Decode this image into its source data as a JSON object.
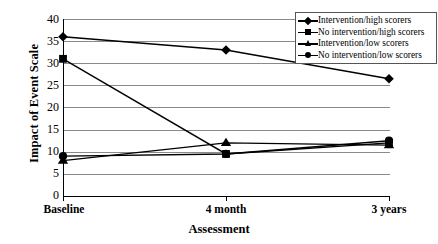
{
  "chart_data": {
    "type": "line",
    "title": "",
    "xlabel": "Assessment",
    "ylabel": "Impact of Event Scale",
    "categories": [
      "Baseline",
      "4 month",
      "3 years"
    ],
    "ylim": [
      0,
      40
    ],
    "yticks": [
      0,
      5,
      10,
      15,
      20,
      25,
      30,
      35,
      40
    ],
    "grid": true,
    "legend_position": "top-right",
    "series": [
      {
        "name": "Intervention/high scorers",
        "marker": "diamond",
        "values": [
          36,
          33,
          26.5
        ]
      },
      {
        "name": "No intervention/high scorers",
        "marker": "square",
        "values": [
          31,
          9.5,
          12
        ]
      },
      {
        "name": "Intervention/low scorers",
        "marker": "triangle",
        "values": [
          8,
          12,
          11.5
        ]
      },
      {
        "name": "No intervention/low scorers",
        "marker": "circle",
        "values": [
          9,
          9.5,
          12.5
        ]
      }
    ]
  },
  "axes": {
    "y_title": "Impact of Event Scale",
    "x_title": "Assessment",
    "y_tick_labels": [
      "40",
      "35",
      "30",
      "25",
      "20",
      "15",
      "10",
      "5",
      "0"
    ],
    "x_tick_labels": [
      "Baseline",
      "4 month",
      "3 years"
    ]
  },
  "legend": {
    "items": [
      {
        "label": "Intervention/high scorers",
        "marker": "diamond-marker"
      },
      {
        "label": "No intervention/high scorers",
        "marker": "square-marker"
      },
      {
        "label": "Intervention/low scorers",
        "marker": "triangle-marker"
      },
      {
        "label": "No intervention/low scorers",
        "marker": "circle-marker"
      }
    ]
  },
  "colors": {
    "line": "#000000",
    "grid": "#8a8a8a",
    "axis": "#000000",
    "background": "#ffffff"
  }
}
